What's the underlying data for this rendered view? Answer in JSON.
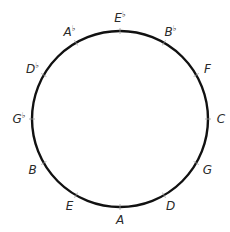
{
  "direction": "clockwise",
  "start_position": "top",
  "notes": [
    {
      "letter": "E",
      "accidental": "♭"
    },
    {
      "letter": "B",
      "accidental": "♭"
    },
    {
      "letter": "F",
      "accidental": ""
    },
    {
      "letter": "C",
      "accidental": ""
    },
    {
      "letter": "G",
      "accidental": ""
    },
    {
      "letter": "D",
      "accidental": ""
    },
    {
      "letter": "A",
      "accidental": ""
    },
    {
      "letter": "E",
      "accidental": ""
    },
    {
      "letter": "B",
      "accidental": ""
    },
    {
      "letter": "G",
      "accidental": "♭"
    },
    {
      "letter": "D",
      "accidental": "♭"
    },
    {
      "letter": "A",
      "accidental": "♭"
    }
  ],
  "colors": {
    "circle_stroke": "#111111",
    "label_text": "#2a2a2a",
    "tick": "#999999",
    "background": "#ffffff"
  }
}
